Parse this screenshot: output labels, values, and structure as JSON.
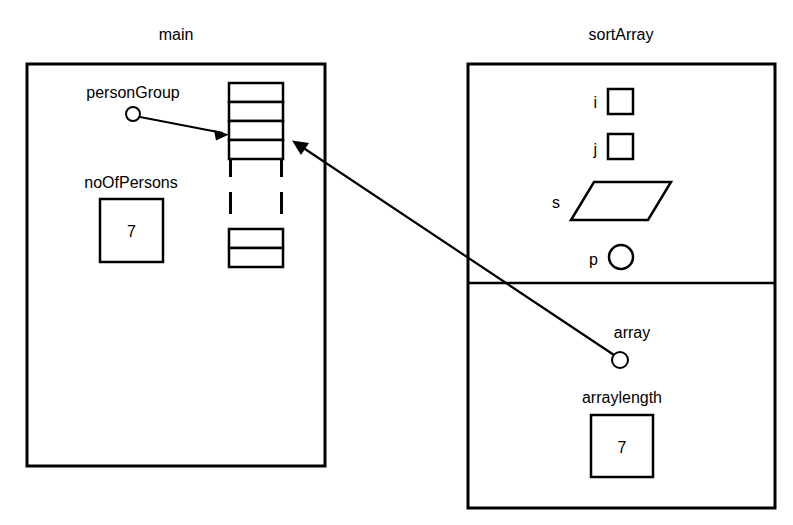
{
  "diagram": {
    "type": "memory-frame-diagram",
    "frames": [
      {
        "id": "main",
        "title": "main",
        "variables": [
          {
            "name": "personGroup",
            "label": "personGroup",
            "kind": "pointer",
            "points_to": "person-array"
          },
          {
            "name": "noOfPersons",
            "label": "noOfPersons",
            "kind": "int-box",
            "value": "7"
          }
        ],
        "array": {
          "id": "person-array",
          "kind": "array-cells",
          "top_cells": 4,
          "bottom_cells": 2,
          "elided": true,
          "elision_style": "dashed-vertical"
        }
      },
      {
        "id": "sortArray",
        "title": "sortArray",
        "sections": [
          {
            "id": "locals",
            "variables": [
              {
                "name": "i",
                "label": "i",
                "kind": "int-box",
                "value": ""
              },
              {
                "name": "j",
                "label": "j",
                "kind": "int-box",
                "value": ""
              },
              {
                "name": "s",
                "label": "s",
                "kind": "parallelogram",
                "value": ""
              },
              {
                "name": "p",
                "label": "p",
                "kind": "pointer-circle",
                "value": ""
              }
            ]
          },
          {
            "id": "parameters",
            "variables": [
              {
                "name": "array",
                "label": "array",
                "kind": "pointer",
                "points_to": "person-array"
              },
              {
                "name": "arraylength",
                "label": "arraylength",
                "kind": "int-box",
                "value": "7"
              }
            ]
          }
        ]
      }
    ],
    "arrows": [
      {
        "id": "personGroup-to-array",
        "from": "personGroup",
        "to": "person-array",
        "style": "solid-arrow"
      },
      {
        "id": "array-param-to-array",
        "from": "array",
        "to": "person-array",
        "style": "solid-arrow"
      }
    ],
    "colors": {
      "stroke": "#000000",
      "fill": "#ffffff",
      "background": "#ffffff"
    }
  }
}
